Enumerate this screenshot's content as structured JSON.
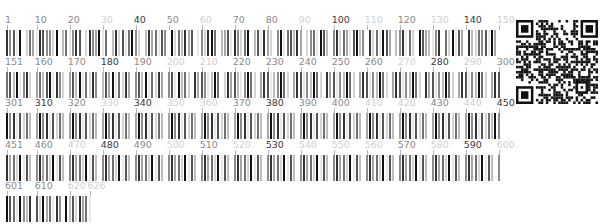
{
  "figure": {
    "type": "sequence-barcode",
    "positions_per_row": 150,
    "total_positions": 626,
    "label_interval": 10,
    "cell_width_px": 3.3,
    "row_pitch_px": 41.5,
    "top_caption_clipped": "——— —— ——— —— ————— ——— — —— — —— ————————"
  },
  "grey_scale": [
    "#ffffff",
    "#e8e8e8",
    "#d4d4d4",
    "#bdbdbd",
    "#a6a6a6",
    "#8c8c8c",
    "#717171",
    "#555555",
    "#333333",
    "#111111"
  ],
  "label_shades": {
    "dark": "#3a3a3a",
    "mid": "#8a8a8a",
    "light": "#d0d0d0"
  },
  "rows": [
    {
      "start": 1,
      "end": 150,
      "labels": [
        {
          "text": "1",
          "pos": 1,
          "shade": "mid"
        },
        {
          "text": "10",
          "pos": 10,
          "shade": "mid"
        },
        {
          "text": "20",
          "pos": 20,
          "shade": "mid"
        },
        {
          "text": "30",
          "pos": 30,
          "shade": "light"
        },
        {
          "text": "40",
          "pos": 40,
          "shade": "dark"
        },
        {
          "text": "50",
          "pos": 50,
          "shade": "mid"
        },
        {
          "text": "60",
          "pos": 60,
          "shade": "light"
        },
        {
          "text": "70",
          "pos": 70,
          "shade": "mid"
        },
        {
          "text": "80",
          "pos": 80,
          "shade": "mid"
        },
        {
          "text": "90",
          "pos": 90,
          "shade": "light"
        },
        {
          "text": "100",
          "pos": 100,
          "shade": "dark"
        },
        {
          "text": "110",
          "pos": 110,
          "shade": "light"
        },
        {
          "text": "120",
          "pos": 120,
          "shade": "mid"
        },
        {
          "text": "130",
          "pos": 130,
          "shade": "light"
        },
        {
          "text": "140",
          "pos": 140,
          "shade": "dark"
        },
        {
          "text": "150",
          "pos": 150,
          "shade": "light"
        }
      ],
      "levels": "8571902641875529036158702854916038271695203846175092638470152896034718526903718420591673840256197305826417935082619740358162097431580629174083265719408362"
    },
    {
      "start": 151,
      "end": 300,
      "labels": [
        {
          "text": "151",
          "pos": 151,
          "shade": "mid"
        },
        {
          "text": "160",
          "pos": 160,
          "shade": "mid"
        },
        {
          "text": "170",
          "pos": 170,
          "shade": "mid"
        },
        {
          "text": "180",
          "pos": 180,
          "shade": "dark"
        },
        {
          "text": "190",
          "pos": 190,
          "shade": "mid"
        },
        {
          "text": "200",
          "pos": 200,
          "shade": "light"
        },
        {
          "text": "210",
          "pos": 210,
          "shade": "light"
        },
        {
          "text": "220",
          "pos": 220,
          "shade": "mid"
        },
        {
          "text": "230",
          "pos": 230,
          "shade": "mid"
        },
        {
          "text": "240",
          "pos": 240,
          "shade": "mid"
        },
        {
          "text": "250",
          "pos": 250,
          "shade": "mid"
        },
        {
          "text": "260",
          "pos": 260,
          "shade": "mid"
        },
        {
          "text": "270",
          "pos": 270,
          "shade": "light"
        },
        {
          "text": "280",
          "pos": 280,
          "shade": "dark"
        },
        {
          "text": "290",
          "pos": 290,
          "shade": "light"
        },
        {
          "text": "300",
          "pos": 300,
          "shade": "mid"
        }
      ],
      "levels": "6739158204637918520473916285037491628405739162840571936208475139602847315962048713596204871539620847153962048715396204871539620847153962048715396204871"
    },
    {
      "start": 301,
      "end": 450,
      "labels": [
        {
          "text": "301",
          "pos": 301,
          "shade": "mid"
        },
        {
          "text": "310",
          "pos": 310,
          "shade": "dark"
        },
        {
          "text": "320",
          "pos": 320,
          "shade": "mid"
        },
        {
          "text": "330",
          "pos": 330,
          "shade": "light"
        },
        {
          "text": "340",
          "pos": 340,
          "shade": "dark"
        },
        {
          "text": "350",
          "pos": 350,
          "shade": "light"
        },
        {
          "text": "360",
          "pos": 360,
          "shade": "light"
        },
        {
          "text": "370",
          "pos": 370,
          "shade": "mid"
        },
        {
          "text": "380",
          "pos": 380,
          "shade": "dark"
        },
        {
          "text": "390",
          "pos": 390,
          "shade": "mid"
        },
        {
          "text": "400",
          "pos": 400,
          "shade": "mid"
        },
        {
          "text": "410",
          "pos": 410,
          "shade": "light"
        },
        {
          "text": "420",
          "pos": 420,
          "shade": "light"
        },
        {
          "text": "430",
          "pos": 430,
          "shade": "mid"
        },
        {
          "text": "440",
          "pos": 440,
          "shade": "light"
        },
        {
          "text": "450",
          "pos": 450,
          "shade": "dark"
        }
      ],
      "levels": "9581726304958172630495817263049581726304958172630495817263049581726304958172630495817263049581726304958172630495817263049581726304958172630495817263"
    },
    {
      "start": 451,
      "end": 600,
      "labels": [
        {
          "text": "451",
          "pos": 451,
          "shade": "mid"
        },
        {
          "text": "460",
          "pos": 460,
          "shade": "mid"
        },
        {
          "text": "470",
          "pos": 470,
          "shade": "light"
        },
        {
          "text": "480",
          "pos": 480,
          "shade": "dark"
        },
        {
          "text": "490",
          "pos": 490,
          "shade": "mid"
        },
        {
          "text": "500",
          "pos": 500,
          "shade": "light"
        },
        {
          "text": "510",
          "pos": 510,
          "shade": "mid"
        },
        {
          "text": "520",
          "pos": 520,
          "shade": "light"
        },
        {
          "text": "530",
          "pos": 530,
          "shade": "dark"
        },
        {
          "text": "540",
          "pos": 540,
          "shade": "light"
        },
        {
          "text": "550",
          "pos": 550,
          "shade": "light"
        },
        {
          "text": "560",
          "pos": 560,
          "shade": "light"
        },
        {
          "text": "570",
          "pos": 570,
          "shade": "mid"
        },
        {
          "text": "580",
          "pos": 580,
          "shade": "light"
        },
        {
          "text": "590",
          "pos": 590,
          "shade": "dark"
        },
        {
          "text": "600",
          "pos": 600,
          "shade": "light"
        }
      ],
      "levels": "8462917305846291730584629173058462917305846291730584629173058462917305846291730584629173058462917305846291730584629173058462917305846291730584629173058"
    },
    {
      "start": 601,
      "end": 626,
      "labels": [
        {
          "text": "601",
          "pos": 601,
          "shade": "mid"
        },
        {
          "text": "610",
          "pos": 610,
          "shade": "mid"
        },
        {
          "text": "620",
          "pos": 620,
          "shade": "light"
        },
        {
          "text": "626",
          "pos": 626,
          "shade": "light"
        }
      ],
      "levels": "97619538072946185093728461"
    }
  ],
  "qr": {
    "name": "qr-code",
    "modules": 33,
    "seed": 73291
  }
}
